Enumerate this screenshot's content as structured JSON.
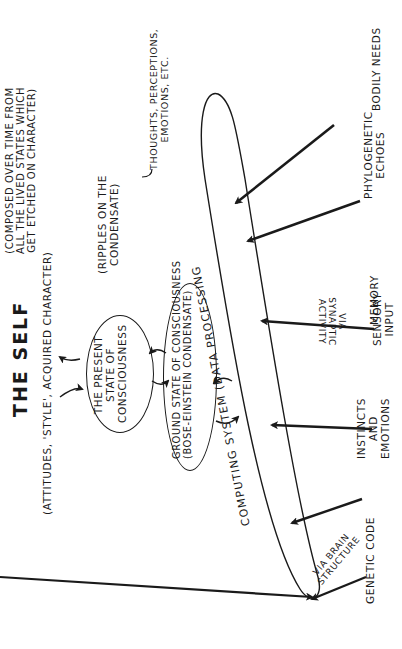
{
  "title": "THE SELF",
  "self_description": "(ATTITUDES, 'STYLE', ACQUIRED CHARACTER)",
  "self_composition_note": "(COMPOSED OVER TIME FROM\nALL THE LIVED STATES WHICH\nGET ETCHED ON CHARACTER)",
  "nodes": {
    "present_state": "THE PRESENT\nSTATE OF\nCONSCIOUSNESS",
    "present_state_note": "(RIPPLES ON THE\nCONDENSATE)",
    "present_state_contents": "THOUGHTS, PERCEPTIONS,\nEMOTIONS, ETC.",
    "ground_state": "GROUND STATE OF CONSCIOUSNESS\n(BOSE-EINSTEIN CONDENSATE)",
    "computing_system": "COMPUTING SYSTEM (DATA PROCESSING"
  },
  "inputs": [
    {
      "label": "GENETIC CODE",
      "via": "VIA BRAIN\nSTRUCTURE"
    },
    {
      "label": "INSTINCTS\nAND\nEMOTIONS",
      "via": ""
    },
    {
      "label": "SENSORY\nINPUT",
      "via": "VIA\nSYNAPTIC\nACTIVITY"
    },
    {
      "label": "MEMORY",
      "via": ""
    },
    {
      "label": "PHYLOGENETIC\nECHOES",
      "via": ""
    },
    {
      "label": "BODILY NEEDS",
      "via": ""
    }
  ],
  "colors": {
    "ink": "#1a1a1a",
    "paper": "#ffffff"
  }
}
